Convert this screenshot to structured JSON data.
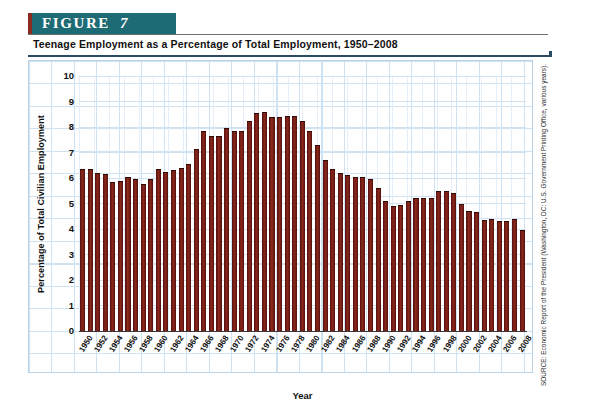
{
  "figure": {
    "banner_label": "FIGURE",
    "number": "7",
    "title": "Teenage Employment as a Percentage of Total Employment, 1950–2008",
    "source": "SOURCE: Economic Report of the President (Washington, DC: U.S. Government Printing Office, various years)."
  },
  "colors": {
    "banner_teal": "#1d6b74",
    "banner_tab_red": "#8c2b20",
    "bar_maroon": "#7a2017",
    "grid_blue": "#cfe2f1",
    "rule_navy": "#2b4b63"
  },
  "chart_data": {
    "type": "bar",
    "title": "Teenage Employment as a Percentage of Total Employment, 1950–2008",
    "xlabel": "Year",
    "ylabel": "Percentage of Total Civilian Employment",
    "ylim": [
      0,
      10
    ],
    "yticks": [
      10,
      9,
      8,
      7,
      6,
      5,
      4,
      3,
      2,
      1,
      0
    ],
    "grid": true,
    "legend": "none",
    "x_tick_step": 2,
    "x_tick_labels": [
      "1950",
      "1952",
      "1954",
      "1956",
      "1958",
      "1960",
      "1962",
      "1964",
      "1966",
      "1968",
      "1970",
      "1972",
      "1974",
      "1976",
      "1978",
      "1980",
      "1982",
      "1984",
      "1986",
      "1988",
      "1990",
      "1992",
      "1994",
      "1996",
      "1998",
      "2000",
      "2002",
      "2004",
      "2006",
      "2008"
    ],
    "categories": [
      1950,
      1951,
      1952,
      1953,
      1954,
      1955,
      1956,
      1957,
      1958,
      1959,
      1960,
      1961,
      1962,
      1963,
      1964,
      1965,
      1966,
      1967,
      1968,
      1969,
      1970,
      1971,
      1972,
      1973,
      1974,
      1975,
      1976,
      1977,
      1978,
      1979,
      1980,
      1981,
      1982,
      1983,
      1984,
      1985,
      1986,
      1987,
      1988,
      1989,
      1990,
      1991,
      1992,
      1993,
      1994,
      1995,
      1996,
      1997,
      1998,
      1999,
      2000,
      2001,
      2002,
      2003,
      2004,
      2005,
      2006,
      2007,
      2008
    ],
    "values": [
      6.35,
      6.35,
      6.2,
      6.15,
      5.85,
      5.9,
      6.05,
      5.95,
      5.75,
      5.95,
      6.35,
      6.25,
      6.3,
      6.4,
      6.55,
      7.15,
      7.85,
      7.65,
      7.65,
      7.95,
      7.85,
      7.85,
      8.25,
      8.55,
      8.6,
      8.4,
      8.4,
      8.45,
      8.45,
      8.25,
      7.85,
      7.3,
      6.7,
      6.35,
      6.2,
      6.1,
      6.05,
      6.05,
      5.95,
      5.6,
      5.1,
      4.9,
      4.95,
      5.1,
      5.2,
      5.2,
      5.2,
      5.5,
      5.5,
      5.4,
      5.0,
      4.7,
      4.65,
      4.35,
      4.4,
      4.3,
      4.3,
      4.4,
      3.95
    ]
  }
}
